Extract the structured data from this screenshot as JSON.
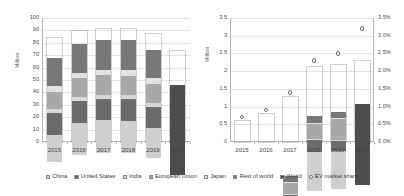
{
  "chart_data": [
    {
      "type": "bar",
      "id": "global-car-sales",
      "title": "",
      "xlabel": "",
      "ylabel": "Million",
      "ylim": [
        0,
        100
      ],
      "ytick_values": [
        0,
        10,
        20,
        30,
        40,
        50,
        60,
        70,
        80,
        90,
        100
      ],
      "ytick_labels": [
        "0",
        "10",
        "20",
        "30",
        "40",
        "50",
        "60",
        "70",
        "80",
        "90",
        "100"
      ],
      "grid": true,
      "stacked": true,
      "categories": [
        "2015",
        "2016",
        "2017",
        "2018",
        "2019",
        "2020"
      ],
      "series": [
        {
          "name": "China",
          "color": "#cfcfcf",
          "values": [
            22.0,
            26.0,
            26.5,
            26.0,
            24.0,
            null
          ]
        },
        {
          "name": "United States",
          "color": "#6b6b6b",
          "values": [
            17.4,
            17.6,
            17.2,
            17.3,
            17.0,
            null
          ]
        },
        {
          "name": "India",
          "color": "#d9d9d9",
          "values": [
            3.0,
            3.3,
            3.5,
            3.6,
            3.2,
            null
          ]
        },
        {
          "name": "European Union",
          "color": "#a8a8a8",
          "values": [
            14.2,
            15.1,
            15.6,
            15.6,
            15.8,
            null
          ]
        },
        {
          "name": "Japan",
          "color": "#e3e3e3",
          "values": [
            4.2,
            4.1,
            4.4,
            4.4,
            4.3,
            null
          ]
        },
        {
          "name": "Rest of world",
          "color": "#777777",
          "values": [
            23.2,
            23.4,
            23.8,
            24.1,
            22.7,
            null
          ]
        },
        {
          "name": "World",
          "color": "#4d4d4d",
          "values": [
            null,
            null,
            null,
            null,
            null,
            73.0
          ]
        }
      ]
    },
    {
      "type": "bar",
      "id": "ev-sales-and-share",
      "title": "",
      "xlabel": "",
      "ylabel": "Million",
      "ylim": [
        0,
        3.5
      ],
      "ytick_values": [
        0,
        0.5,
        1,
        1.5,
        2,
        2.5,
        3,
        3.5
      ],
      "ytick_labels": [
        "0",
        "0.5",
        "1",
        "1.5",
        "2",
        "2.5",
        "3",
        "3.5"
      ],
      "y2label": "",
      "y2lim": [
        0,
        3.5
      ],
      "y2tick_values": [
        0,
        0.5,
        1,
        1.5,
        2,
        2.5,
        3,
        3.5
      ],
      "y2tick_labels": [
        "0.0%",
        "0.5%",
        "1.0%",
        "1.5%",
        "2.0%",
        "2.5%",
        "3.0%",
        "3.5%"
      ],
      "grid": true,
      "stacked": true,
      "categories": [
        "2015",
        "2016",
        "2017",
        "2018",
        "2019",
        "2020"
      ],
      "series": [
        {
          "name": "China",
          "color": "#cfcfcf",
          "values": [
            0.21,
            0.34,
            0.6,
            1.11,
            1.06,
            null
          ]
        },
        {
          "name": "United States",
          "color": "#6b6b6b",
          "values": [
            0.12,
            0.1,
            0.14,
            0.34,
            0.31,
            null
          ]
        },
        {
          "name": "India",
          "color": "#d9d9d9",
          "values": [
            0.01,
            0.01,
            0.01,
            0.02,
            0.02,
            null
          ]
        },
        {
          "name": "European Union",
          "color": "#a8a8a8",
          "values": [
            0.16,
            0.19,
            0.31,
            0.42,
            0.59,
            null
          ]
        },
        {
          "name": "Japan",
          "color": "#e3e3e3",
          "values": [
            0.03,
            0.03,
            0.05,
            0.05,
            0.03,
            null
          ]
        },
        {
          "name": "Rest of world",
          "color": "#777777",
          "values": [
            0.06,
            0.13,
            0.16,
            0.17,
            0.17,
            null
          ]
        },
        {
          "name": "World",
          "color": "#4d4d4d",
          "values": [
            null,
            null,
            null,
            null,
            null,
            2.28
          ]
        }
      ],
      "overlay_series": [
        {
          "name": "EV market share",
          "type": "scatter",
          "marker": "open-circle",
          "color": "#6f6f6f",
          "axis": "secondary",
          "unit": "%",
          "values": [
            0.7,
            0.9,
            1.4,
            2.3,
            2.5,
            3.2
          ]
        }
      ]
    }
  ],
  "legend": {
    "position": "bottom",
    "items": [
      {
        "label": "China",
        "color": "#cfcfcf",
        "marker": "square"
      },
      {
        "label": "United States",
        "color": "#6b6b6b",
        "marker": "square"
      },
      {
        "label": "India",
        "color": "#d9d9d9",
        "marker": "square"
      },
      {
        "label": "European Union",
        "color": "#a8a8a8",
        "marker": "square"
      },
      {
        "label": "Japan",
        "color": "#e3e3e3",
        "marker": "square"
      },
      {
        "label": "Rest of world",
        "color": "#777777",
        "marker": "square"
      },
      {
        "label": "World",
        "color": "#4d4d4d",
        "marker": "square"
      },
      {
        "label": "EV market share",
        "color": "#ffffff",
        "marker": "circle"
      }
    ]
  }
}
